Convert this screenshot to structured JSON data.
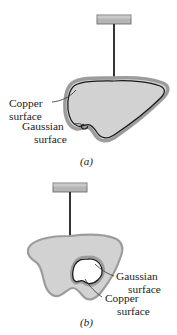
{
  "figure": {
    "background_color": "#ffffff",
    "panels": [
      {
        "id": "panel-a",
        "caption": "(a)",
        "caption_x": 80,
        "caption_y": 165,
        "plate": {
          "name": "support-plate",
          "x": 97,
          "y": 15,
          "width": 34,
          "height": 9,
          "fill": "#b3b3b3",
          "stroke": "#6e6e6e"
        },
        "stem": {
          "name": "support-stem",
          "x": 114,
          "y1": 24,
          "y2": 81,
          "color": "#111111",
          "width": 1.6
        },
        "body": {
          "name": "charged-conductor-blob",
          "fill": "#d2d2d2",
          "outer_stroke": "#9a9a9a",
          "outer_width": 3.2,
          "inner_stroke": "#1a1a1a",
          "inner_width": 1.3
        },
        "labels": [
          {
            "name": "copper-surface-label",
            "lines": [
              "Copper",
              "surface"
            ],
            "x": 9,
            "y": 107,
            "align": "start",
            "leader_from": [
              52,
              103
            ],
            "leader_to": [
              96,
              96
            ]
          },
          {
            "name": "gaussian-surface-label",
            "lines": [
              "Gaussian",
              "surface"
            ],
            "x": 24,
            "y": 130,
            "align": "start",
            "leader_from": [
              75,
              126
            ],
            "leader_to": [
              90,
              128
            ]
          }
        ]
      },
      {
        "id": "panel-b",
        "caption": "(b)",
        "caption_x": 80,
        "caption_y": 326,
        "plate": {
          "name": "support-plate",
          "x": 53,
          "y": 183,
          "width": 34,
          "height": 9,
          "fill": "#b3b3b3",
          "stroke": "#6e6e6e"
        },
        "stem": {
          "name": "support-stem",
          "x": 70,
          "y1": 192,
          "y2": 240,
          "color": "#111111",
          "width": 1.6
        },
        "body": {
          "name": "charged-conductor-blob",
          "fill": "#d2d2d2",
          "outer_stroke": "#9a9a9a",
          "outer_width": 2.2,
          "inner_stroke": "#1a1a1a",
          "inner_width": 1.3
        },
        "cavity": {
          "name": "inner-cavity",
          "fill": "#ffffff",
          "outer_stroke": "#9a9a9a",
          "inner_stroke": "#1a1a1a"
        },
        "labels": [
          {
            "name": "gaussian-surface-label",
            "lines": [
              "Gaussian",
              "surface"
            ],
            "x": 116,
            "y": 280,
            "align": "start",
            "leader_from": [
              114,
              276
            ],
            "leader_to": [
              92,
              266
            ]
          },
          {
            "name": "copper-surface-label",
            "lines": [
              "Copper",
              "surface"
            ],
            "x": 104,
            "y": 302,
            "align": "start",
            "leader_from": [
              102,
              298
            ],
            "leader_to": [
              84,
              278
            ]
          }
        ]
      }
    ]
  }
}
